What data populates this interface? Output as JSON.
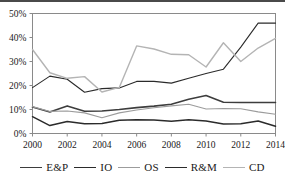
{
  "chart_data": {
    "type": "line",
    "title": "",
    "subtitle": "",
    "xlabel": "",
    "ylabel": "",
    "xlim": [
      2000,
      2014
    ],
    "ylim": [
      0,
      50
    ],
    "y_tick_labels": [
      "0%",
      "10%",
      "20%",
      "30%",
      "40%",
      "50%"
    ],
    "y_ticks": [
      0,
      10,
      20,
      30,
      40,
      50
    ],
    "x_tick_labels": [
      "2000",
      "2002",
      "2004",
      "2006",
      "2008",
      "2010",
      "2012",
      "2014"
    ],
    "x_ticks": [
      2000,
      2002,
      2004,
      2006,
      2008,
      2010,
      2012,
      2014
    ],
    "x": [
      2000,
      2001,
      2002,
      2003,
      2004,
      2005,
      2006,
      2007,
      2008,
      2009,
      2010,
      2011,
      2012,
      2013,
      2014
    ],
    "grid": false,
    "legend_position": "bottom",
    "series": [
      {
        "name": "E&P",
        "color": "#3d3d3d",
        "width": 1.6,
        "values": [
          11.0,
          9.0,
          11.5,
          9.3,
          9.4,
          10.0,
          10.8,
          11.4,
          12.2,
          14.3,
          15.8,
          13.0,
          12.9,
          12.9,
          12.9
        ]
      },
      {
        "name": "IO",
        "color": "#2b2b2b",
        "width": 1.1,
        "values": [
          19.1,
          23.9,
          22.6,
          17.2,
          18.7,
          19.0,
          21.7,
          21.7,
          21.0,
          23.0,
          25.0,
          26.8,
          36.0,
          46.0,
          46.0
        ]
      },
      {
        "name": "OS",
        "color": "#9c9c9c",
        "width": 1.1,
        "values": [
          11.2,
          9.2,
          9.4,
          8.6,
          6.6,
          8.6,
          9.8,
          10.7,
          11.5,
          12.2,
          10.2,
          10.4,
          10.3,
          9.0,
          8.0
        ]
      },
      {
        "name": "R&M",
        "color": "#2b2b2b",
        "width": 1.5,
        "values": [
          7.0,
          3.3,
          5.0,
          4.1,
          4.2,
          5.5,
          5.7,
          5.6,
          5.1,
          5.7,
          5.2,
          4.0,
          4.1,
          5.2,
          3.0
        ]
      },
      {
        "name": "CD",
        "color": "#b4b4b4",
        "width": 1.4,
        "values": [
          35.0,
          25.3,
          23.0,
          23.7,
          17.3,
          19.2,
          36.5,
          35.2,
          33.0,
          32.8,
          27.7,
          37.8,
          30.0,
          35.6,
          39.6
        ]
      }
    ]
  },
  "legend": {
    "items": [
      {
        "label": "E&P"
      },
      {
        "label": "IO"
      },
      {
        "label": "OS"
      },
      {
        "label": "R&M"
      },
      {
        "label": "CD"
      }
    ]
  }
}
